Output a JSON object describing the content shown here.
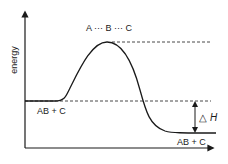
{
  "diagram": {
    "type": "energy-profile",
    "axis": {
      "y_label": "energy"
    },
    "labels": {
      "transition_state": "A ··· B ··· C",
      "reactants": "AB + C",
      "products": "AB + C",
      "delta_h_symbol": "△",
      "delta_h_var": "H"
    },
    "colors": {
      "line": "#1a1a1a",
      "background": "#ffffff"
    }
  }
}
